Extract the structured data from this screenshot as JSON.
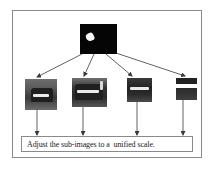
{
  "diagram": {
    "type": "flow",
    "source_image": {
      "label": "mask-image",
      "description": "black binary mask with single white blob"
    },
    "sub_images": [
      {
        "index": 1,
        "description": "grayscale vehicle crop, largest scale"
      },
      {
        "index": 2,
        "description": "grayscale vehicle crop"
      },
      {
        "index": 3,
        "description": "grayscale vehicle crop, smaller scale"
      },
      {
        "index": 4,
        "description": "grayscale vehicle crop, smallest scale"
      }
    ],
    "caption": "Adjust the sub-images to a  unified scale.",
    "colors": {
      "frame_border": "#8a8a8a",
      "arrow": "#3a3a3a",
      "mask_background": "#050505",
      "mask_blob": "#f4f4f4",
      "text": "#1a1a1a"
    }
  }
}
